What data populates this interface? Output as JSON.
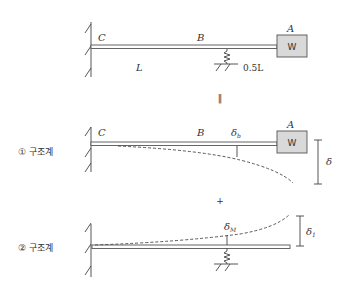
{
  "top_structure": {
    "support_label": "C",
    "mid_label": "B",
    "end_label": "A",
    "weight_label": "W",
    "span_label": "L",
    "overhang_label": "0.5L"
  },
  "equals_symbol": "‖",
  "plus_symbol": "+",
  "system1": {
    "label": "① 구조계",
    "support_label": "C",
    "mid_label": "B",
    "end_label": "A",
    "weight_label": "W",
    "deflection_b_symbol": "δ",
    "deflection_b_sub": "b",
    "total_deflection_symbol": "δ"
  },
  "system2": {
    "label": "② 구조계",
    "deflection_m_symbol": "δ",
    "deflection_m_sub": "M",
    "deflection_1_symbol": "δ",
    "deflection_1_sub": "1"
  },
  "colors": {
    "line": "#444444",
    "weight_fill": "#d9d9d9"
  }
}
